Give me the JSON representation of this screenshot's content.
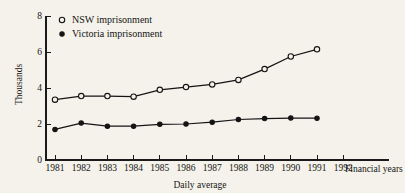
{
  "chart_data": {
    "type": "line",
    "title": "",
    "subtitle": "",
    "xlabel": "Daily average",
    "ylabel": "Thousands",
    "x_axis_note": "Financial years",
    "categories": [
      "1981",
      "1982",
      "1983",
      "1984",
      "1985",
      "1986",
      "1987",
      "1988",
      "1989",
      "1990",
      "1991",
      "1992"
    ],
    "x_tick_labels": [
      "1981",
      "1982",
      "1983",
      "1984",
      "1985",
      "1986",
      "1987",
      "1988",
      "1989",
      "1990",
      "1991",
      "1992"
    ],
    "y_tick_labels": [
      "0",
      "2",
      "4",
      "6",
      "8"
    ],
    "y_ticks": [
      0,
      2,
      4,
      6,
      8
    ],
    "ylim": [
      0,
      8
    ],
    "grid": false,
    "legend_position": "top-left-inside",
    "series": [
      {
        "name": "NSW imprisonment",
        "marker": "open-circle",
        "x": [
          "1981",
          "1982",
          "1983",
          "1984",
          "1985",
          "1986",
          "1987",
          "1988",
          "1989",
          "1990",
          "1991"
        ],
        "values": [
          3.35,
          3.55,
          3.55,
          3.52,
          3.9,
          4.05,
          4.2,
          4.45,
          5.05,
          5.75,
          6.15
        ]
      },
      {
        "name": "Victoria imprisonment",
        "marker": "filled-circle",
        "x": [
          "1981",
          "1982",
          "1983",
          "1984",
          "1985",
          "1986",
          "1987",
          "1988",
          "1989",
          "1990",
          "1991"
        ],
        "values": [
          1.7,
          2.05,
          1.88,
          1.88,
          1.98,
          2.0,
          2.1,
          2.25,
          2.3,
          2.33,
          2.32
        ]
      }
    ],
    "colors": {
      "background": "#f4f2ea",
      "line": "#141414",
      "text": "#141414"
    }
  }
}
